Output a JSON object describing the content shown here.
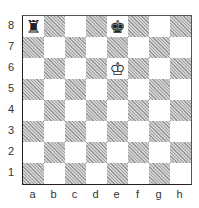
{
  "diagram": {
    "type": "chess-position",
    "files": [
      "a",
      "b",
      "c",
      "d",
      "e",
      "f",
      "g",
      "h"
    ],
    "ranks": [
      "8",
      "7",
      "6",
      "5",
      "4",
      "3",
      "2",
      "1"
    ],
    "pieces": [
      {
        "square": "a8",
        "piece": "rook",
        "color": "black",
        "glyph": "♜"
      },
      {
        "square": "e8",
        "piece": "king",
        "color": "black",
        "glyph": "♚"
      },
      {
        "square": "e6",
        "piece": "king",
        "color": "white",
        "glyph": "♔"
      }
    ],
    "colors": {
      "dark_square": "#bdbdbd",
      "light_square": "#ffffff",
      "border": "#222222"
    }
  }
}
